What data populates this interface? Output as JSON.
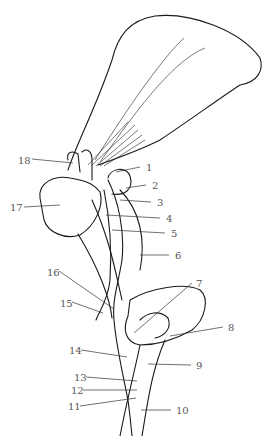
{
  "figure": {
    "type": "anatomical line drawing"
  },
  "labels": [
    {
      "num": "1",
      "x": 146,
      "y": 167,
      "side": "right"
    },
    {
      "num": "2",
      "x": 152,
      "y": 185,
      "side": "right"
    },
    {
      "num": "3",
      "x": 157,
      "y": 202,
      "side": "right"
    },
    {
      "num": "4",
      "x": 166,
      "y": 218,
      "side": "right"
    },
    {
      "num": "5",
      "x": 171,
      "y": 233,
      "side": "right"
    },
    {
      "num": "6",
      "x": 175,
      "y": 255,
      "side": "right"
    },
    {
      "num": "7",
      "x": 196,
      "y": 283,
      "side": "right"
    },
    {
      "num": "8",
      "x": 228,
      "y": 327,
      "side": "right"
    },
    {
      "num": "9",
      "x": 196,
      "y": 365,
      "side": "right"
    },
    {
      "num": "10",
      "x": 176,
      "y": 410,
      "side": "right"
    },
    {
      "num": "11",
      "x": 68,
      "y": 406,
      "side": "left"
    },
    {
      "num": "12",
      "x": 71,
      "y": 390,
      "side": "left"
    },
    {
      "num": "13",
      "x": 74,
      "y": 377,
      "side": "left"
    },
    {
      "num": "14",
      "x": 69,
      "y": 350,
      "side": "left"
    },
    {
      "num": "15",
      "x": 60,
      "y": 303,
      "side": "left"
    },
    {
      "num": "16",
      "x": 47,
      "y": 272,
      "side": "left"
    },
    {
      "num": "17",
      "x": 10,
      "y": 207,
      "side": "left"
    },
    {
      "num": "18",
      "x": 18,
      "y": 160,
      "side": "left"
    }
  ]
}
